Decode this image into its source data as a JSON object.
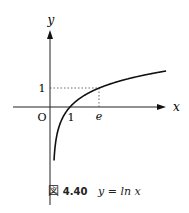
{
  "chart_data": {
    "type": "line",
    "title": "y = ln x",
    "xlabel": "x",
    "ylabel": "y",
    "function": "ln x",
    "x": [
      0.05,
      0.1,
      0.2,
      0.3,
      0.5,
      0.75,
      1,
      1.5,
      2,
      2.718,
      3,
      4,
      5,
      6
    ],
    "values": [
      -3.0,
      -2.303,
      -1.609,
      -1.204,
      -0.693,
      -0.288,
      0,
      0.405,
      0.693,
      1,
      1.099,
      1.386,
      1.609,
      1.792
    ],
    "tick_labels": {
      "x": [
        "O",
        "1",
        "e"
      ],
      "y": [
        "1"
      ]
    },
    "annotations": [
      "dotted guide from (e,0) to (e,1) to (0,1)"
    ],
    "grid": false,
    "legend": null
  },
  "figure": {
    "label": "図",
    "number": "4.40",
    "caption": "y = ln x"
  },
  "axes": {
    "x_label": "x",
    "y_label": "y",
    "origin": "O",
    "x_tick_1": "1",
    "x_tick_e": "e",
    "y_tick_1": "1"
  }
}
